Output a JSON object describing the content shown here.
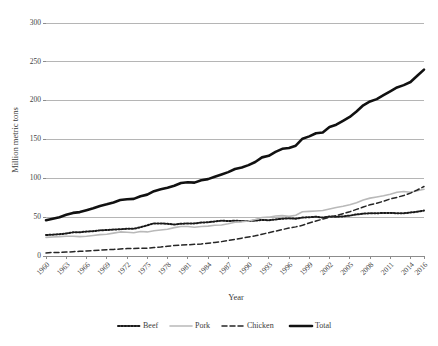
{
  "chart_data": {
    "type": "line",
    "title": "",
    "xlabel": "Year",
    "ylabel": "Million metric tons",
    "ylim": [
      0,
      300
    ],
    "ytick_values": [
      0,
      50,
      100,
      150,
      200,
      250,
      300
    ],
    "ytick_labels": [
      "0",
      "50",
      "100",
      "150",
      "200",
      "250",
      "300"
    ],
    "grid": "horizontal",
    "legend_position": "bottom",
    "xlim": [
      1960,
      2016
    ],
    "xtick_labels": [
      "1960",
      "1963",
      "1966",
      "1969",
      "1972",
      "1975",
      "1978",
      "1981",
      "1984",
      "1987",
      "1990",
      "1993",
      "1996",
      "1999",
      "2002",
      "2005",
      "2008",
      "2011",
      "2014",
      "2016"
    ],
    "x": [
      1960,
      1961,
      1962,
      1963,
      1964,
      1965,
      1966,
      1967,
      1968,
      1969,
      1970,
      1971,
      1972,
      1973,
      1974,
      1975,
      1976,
      1977,
      1978,
      1979,
      1980,
      1981,
      1982,
      1983,
      1984,
      1985,
      1986,
      1987,
      1988,
      1989,
      1990,
      1991,
      1992,
      1993,
      1994,
      1995,
      1996,
      1997,
      1998,
      1999,
      2000,
      2001,
      2002,
      2003,
      2004,
      2005,
      2006,
      2007,
      2008,
      2009,
      2010,
      2011,
      2012,
      2013,
      2014,
      2015,
      2016
    ],
    "series": [
      {
        "name": "Beef",
        "style": "dotted",
        "color": "#1a1a1a",
        "values": [
          27.0,
          27.5,
          28.0,
          29.0,
          30.5,
          30.5,
          31.5,
          32.0,
          33.0,
          33.5,
          34.0,
          34.5,
          35.0,
          35.0,
          37.0,
          39.5,
          42.0,
          42.0,
          41.5,
          40.5,
          41.5,
          42.0,
          42.0,
          43.0,
          43.5,
          44.5,
          45.5,
          45.0,
          45.5,
          45.0,
          45.0,
          45.5,
          46.5,
          46.0,
          47.0,
          48.0,
          48.5,
          48.0,
          49.5,
          50.0,
          50.5,
          49.5,
          51.0,
          50.5,
          51.0,
          52.0,
          53.5,
          54.5,
          55.0,
          55.0,
          55.5,
          55.5,
          55.0,
          55.0,
          56.0,
          57.0,
          58.5
        ]
      },
      {
        "name": "Pork",
        "style": "solid",
        "color": "#b9b9b9",
        "values": [
          24.0,
          24.5,
          25.0,
          25.5,
          25.5,
          25.0,
          25.5,
          26.5,
          27.5,
          28.0,
          29.5,
          31.0,
          30.5,
          30.0,
          31.5,
          31.0,
          32.5,
          33.5,
          34.5,
          36.5,
          38.0,
          38.0,
          37.0,
          38.0,
          38.5,
          39.5,
          40.0,
          41.5,
          43.5,
          44.0,
          45.0,
          47.0,
          49.5,
          50.0,
          51.5,
          52.0,
          51.0,
          52.5,
          57.0,
          57.5,
          58.0,
          58.5,
          60.5,
          62.5,
          64.0,
          66.0,
          68.5,
          72.0,
          74.5,
          76.0,
          77.5,
          79.5,
          82.0,
          83.0,
          82.0,
          84.0,
          86.0
        ]
      },
      {
        "name": "Chicken",
        "style": "dashed",
        "color": "#262626",
        "values": [
          4.0,
          4.5,
          4.5,
          5.0,
          5.5,
          6.0,
          6.5,
          7.0,
          7.5,
          8.0,
          8.5,
          9.0,
          9.5,
          9.5,
          10.0,
          10.0,
          11.0,
          11.5,
          12.5,
          13.5,
          14.0,
          14.5,
          15.0,
          15.5,
          16.5,
          17.5,
          18.5,
          20.0,
          21.5,
          23.0,
          24.5,
          26.0,
          28.0,
          30.0,
          32.0,
          34.0,
          36.0,
          37.5,
          39.5,
          42.5,
          45.0,
          47.5,
          50.0,
          52.0,
          54.5,
          57.0,
          60.0,
          63.0,
          66.0,
          68.0,
          70.5,
          73.5,
          75.5,
          78.0,
          81.0,
          85.0,
          89.5
        ]
      },
      {
        "name": "Total",
        "style": "thick-solid",
        "color": "#111111",
        "values": [
          46.0,
          48.0,
          50.0,
          53.0,
          55.5,
          56.5,
          59.0,
          61.5,
          64.5,
          66.5,
          69.0,
          72.0,
          73.0,
          73.5,
          77.0,
          79.0,
          83.5,
          86.0,
          88.0,
          90.5,
          94.0,
          95.0,
          94.5,
          97.5,
          99.0,
          102.0,
          105.0,
          108.0,
          112.0,
          114.0,
          117.0,
          121.0,
          127.0,
          129.0,
          134.0,
          138.0,
          139.0,
          142.0,
          151.0,
          154.0,
          158.0,
          159.0,
          166.0,
          169.0,
          174.0,
          179.0,
          186.0,
          194.0,
          199.0,
          202.0,
          207.0,
          212.0,
          217.0,
          220.0,
          224.0,
          232.0,
          240.0
        ]
      }
    ],
    "legend": [
      {
        "label": "Beef",
        "style": "dotted",
        "color": "#1a1a1a"
      },
      {
        "label": "Pork",
        "style": "solid",
        "color": "#b9b9b9"
      },
      {
        "label": "Chicken",
        "style": "dashed",
        "color": "#262626"
      },
      {
        "label": "Total",
        "style": "thick-solid",
        "color": "#111111"
      }
    ]
  }
}
